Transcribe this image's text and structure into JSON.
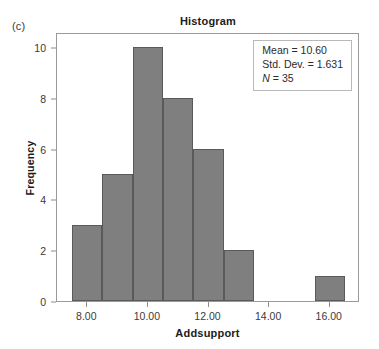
{
  "panel": {
    "letter": "(c)"
  },
  "chart": {
    "title": "Histogram",
    "xlabel": "Addsupport",
    "ylabel": "Frequency"
  },
  "stats": {
    "mean_line": "Mean = 10.60",
    "stddev_line": "Std. Dev. = 1.631",
    "n_symbol": "N",
    "n_value": " = 35"
  },
  "axes": {
    "x_ticks": [
      "8.00",
      "10.00",
      "12.00",
      "14.00",
      "16.00"
    ],
    "x_tick_values": [
      8,
      10,
      12,
      14,
      16
    ],
    "y_ticks": [
      "0",
      "2",
      "4",
      "6",
      "8",
      "10"
    ],
    "y_tick_values": [
      0,
      2,
      4,
      6,
      8,
      10
    ],
    "xlim": [
      7.0,
      17.0
    ],
    "ylim": [
      0,
      10.6
    ]
  },
  "style": {
    "bar_fill": "#7f7f7f",
    "bar_edge": "#5a5a5a",
    "frame": "#9a9a9a",
    "text": "#231f20"
  },
  "chart_data": {
    "type": "bar",
    "title": "Histogram",
    "xlabel": "Addsupport",
    "ylabel": "Frequency",
    "xlim": [
      7.0,
      17.0
    ],
    "ylim": [
      0,
      10.6
    ],
    "grid": false,
    "legend": null,
    "bin_width": 1.0,
    "bin_edges": [
      7.5,
      8.5,
      9.5,
      10.5,
      11.5,
      12.5,
      13.5,
      15.5,
      16.5
    ],
    "bins": [
      {
        "left": 7.5,
        "right": 8.5,
        "center": 8.0,
        "frequency": 3
      },
      {
        "left": 8.5,
        "right": 9.5,
        "center": 9.0,
        "frequency": 5
      },
      {
        "left": 9.5,
        "right": 10.5,
        "center": 10.0,
        "frequency": 10
      },
      {
        "left": 10.5,
        "right": 11.5,
        "center": 11.0,
        "frequency": 8
      },
      {
        "left": 11.5,
        "right": 12.5,
        "center": 12.0,
        "frequency": 6
      },
      {
        "left": 12.5,
        "right": 13.5,
        "center": 13.0,
        "frequency": 2
      },
      {
        "left": 15.5,
        "right": 16.5,
        "center": 16.0,
        "frequency": 1
      }
    ],
    "categories": [
      8.0,
      9.0,
      10.0,
      11.0,
      12.0,
      13.0,
      16.0
    ],
    "values": [
      3,
      5,
      10,
      8,
      6,
      2,
      1
    ],
    "annotations": {
      "mean": 10.6,
      "std_dev": 1.631,
      "n": 35
    }
  }
}
